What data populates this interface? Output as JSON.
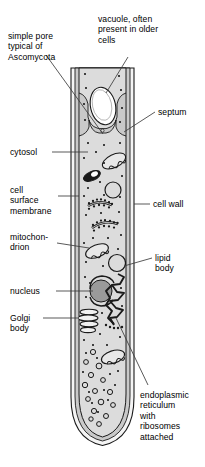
{
  "diagram": {
    "colors": {
      "cytoplasm": "#dcdcdc",
      "wall_outer": "#f2f2f2",
      "wall_mid": "#c9c9c9",
      "outline": "#1a1a1a",
      "nucleus_fill": "#9a9a9a",
      "vacuole_fill": "#ffffff",
      "leader": "#3c3c3c",
      "text": "#000000",
      "background": "#ffffff"
    }
  },
  "labels": {
    "simple_pore": "simple pore\ntypical of\nAscomycota",
    "vacuole": "vacuole, often\npresent in older\ncells",
    "septum": "septum",
    "cytosol": "cytosol",
    "cell_surface_membrane": "cell\nsurface\nmembrane",
    "cell_wall": "cell wall",
    "mitochondrion": "mitochon-\ndrion",
    "lipid_body": "lipid\nbody",
    "nucleus": "nucleus",
    "golgi_body": "Golgi\nbody",
    "endoplasmic_reticulum": "endoplasmic\nreticulum\nwith\nribosomes\nattached"
  },
  "structures": [
    {
      "name": "cell-wall",
      "kind": "boundary"
    },
    {
      "name": "cell-surface-membrane",
      "kind": "boundary"
    },
    {
      "name": "cytosol",
      "kind": "compartment"
    },
    {
      "name": "septum",
      "kind": "partition"
    },
    {
      "name": "simple-pore",
      "kind": "aperture"
    },
    {
      "name": "vacuole",
      "kind": "organelle"
    },
    {
      "name": "nucleus",
      "kind": "organelle"
    },
    {
      "name": "golgi-body",
      "kind": "organelle"
    },
    {
      "name": "mitochondrion",
      "kind": "organelle",
      "count": 3
    },
    {
      "name": "lipid-body",
      "kind": "organelle"
    },
    {
      "name": "endoplasmic-reticulum",
      "kind": "organelle"
    },
    {
      "name": "ribosome",
      "kind": "particle"
    },
    {
      "name": "apical-vesicle",
      "kind": "particle"
    }
  ]
}
